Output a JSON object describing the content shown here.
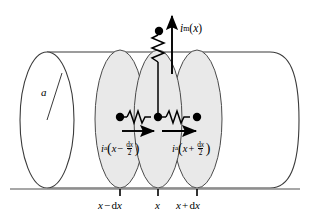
{
  "figure": {
    "type": "cable-theory-axon-diagram",
    "canvas": {
      "width": 311,
      "height": 222,
      "background": "#ffffff"
    },
    "colors": {
      "stroke": "#3a3a3a",
      "ink": "#000000",
      "disc_fill": "#e9e9e9",
      "disc_stroke": "#4a4a4a",
      "baseline": "#808080"
    }
  },
  "labels": {
    "radius": {
      "text": "a",
      "name": "radius-label"
    },
    "membrane_current": {
      "i": "i",
      "sub": "m",
      "open": "(",
      "arg": "x",
      "close": ")",
      "plain": "i_m(x)"
    },
    "axial_current_left": {
      "i": "i",
      "sub": "a",
      "open": "(",
      "arg": "x",
      "op": "−",
      "num": "d",
      "num_var": "x",
      "den": "2",
      "close": ")",
      "plain": "i_a(x − dx/2)"
    },
    "axial_current_right": {
      "i": "i",
      "sub": "a",
      "open": "(",
      "arg": "x",
      "op": "+",
      "num": "d",
      "num_var": "x",
      "den": "2",
      "close": ")",
      "plain": "i_a(x + dx/2)"
    }
  },
  "axis": {
    "name": "x-axis",
    "ticks": [
      {
        "id": "tick-left",
        "pre": "x",
        "op": "−",
        "d": "d",
        "var": "x",
        "plain": "x − dx"
      },
      {
        "id": "tick-center",
        "pre": "x",
        "op": "",
        "d": "",
        "var": "",
        "plain": "x"
      },
      {
        "id": "tick-right",
        "pre": "x",
        "op": "+",
        "d": "d",
        "var": "x",
        "plain": "x + dx"
      }
    ]
  },
  "elements": {
    "discs": [
      {
        "id": "disc-left",
        "cx": 120,
        "cy": 118,
        "rx": 25,
        "ry": 70
      },
      {
        "id": "disc-center",
        "cx": 158,
        "cy": 118,
        "rx": 24,
        "ry": 70
      },
      {
        "id": "disc-right",
        "cx": 197,
        "cy": 118,
        "rx": 25,
        "ry": 70
      }
    ],
    "nodes": [
      {
        "id": "node-left",
        "cx": 120,
        "cy": 117,
        "r": 4.2
      },
      {
        "id": "node-center",
        "cx": 158,
        "cy": 117,
        "r": 4.2
      },
      {
        "id": "node-right",
        "cx": 197,
        "cy": 117,
        "r": 4.2
      },
      {
        "id": "node-top",
        "cx": 159,
        "cy": 31,
        "r": 4.2
      }
    ],
    "resistors": [
      {
        "id": "resistor-axial-left",
        "orientation": "horizontal"
      },
      {
        "id": "resistor-axial-right",
        "orientation": "horizontal"
      },
      {
        "id": "resistor-membrane",
        "orientation": "vertical"
      }
    ],
    "arrows": [
      {
        "id": "arrow-axial-left",
        "direction": "right"
      },
      {
        "id": "arrow-axial-right",
        "direction": "right"
      },
      {
        "id": "arrow-membrane",
        "direction": "up"
      }
    ]
  }
}
